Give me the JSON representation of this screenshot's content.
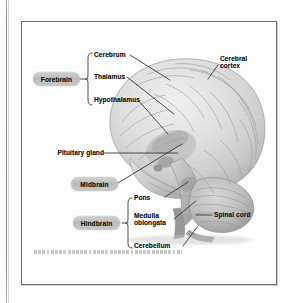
{
  "figure": {
    "credit_text": "Adapted from Brain Facts, Society for Neuroscience, lateral view of the human brain"
  },
  "divisions": [
    {
      "id": "forebrain",
      "label": "Forebrain"
    },
    {
      "id": "midbrain",
      "label": "Midbrain"
    },
    {
      "id": "hindbrain",
      "label": "Hindbrain"
    }
  ],
  "forebrain_parts": [
    {
      "id": "cerebrum",
      "label": "Cerebrum"
    },
    {
      "id": "thalamus",
      "label": "Thalamus"
    },
    {
      "id": "hypothalamus",
      "label": "Hypothalamus"
    }
  ],
  "hindbrain_parts": [
    {
      "id": "pons",
      "label": "Pons"
    },
    {
      "id": "medulla",
      "label": "Medulla\noblongata"
    },
    {
      "id": "cerebellum",
      "label": "Cerebellum"
    }
  ],
  "other_labels": [
    {
      "id": "cerebral-cortex",
      "label": "Cerebral\ncortex"
    },
    {
      "id": "pituitary-gland",
      "label": "Pituitary gland"
    },
    {
      "id": "spinal-cord",
      "label": "Spinal cord"
    }
  ],
  "colors": {
    "pill_fill": "#c4c4c4",
    "text": "#1c1c1c",
    "frame_border": "#6e6e6e",
    "leader_line": "#3a3a3a",
    "brain_light": "#ebebeb",
    "brain_mid": "#d2d2d2",
    "brain_dark": "#a9a9a9",
    "page_background": "#fdfdfd"
  }
}
